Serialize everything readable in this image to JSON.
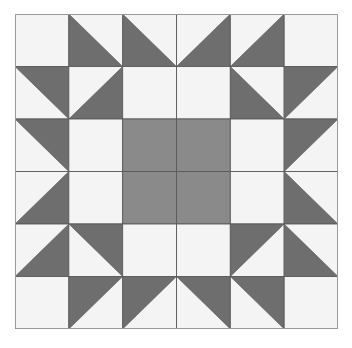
{
  "diagram": {
    "grid": {
      "rows": 6,
      "cols": 6
    },
    "colors": {
      "light": "#f4f4f4",
      "dark": "#6e6e6e",
      "center": "#8a8a8a",
      "line": "#5a5a5a",
      "border": "#9a9a9a"
    },
    "legend_codes": {
      "W": "plain light square",
      "C": "plain medium-gray center square",
      "TL": "half-square triangle, dark in top-left half",
      "TR": "half-square triangle, dark in top-right half",
      "BL": "half-square triangle, dark in bottom-left half",
      "BR": "half-square triangle, dark in bottom-right half"
    },
    "cells": [
      [
        "W",
        "BL",
        "BL",
        "BR",
        "BR",
        "W"
      ],
      [
        "TR",
        "BR",
        "W",
        "W",
        "BL",
        "TL"
      ],
      [
        "TR",
        "W",
        "C",
        "C",
        "W",
        "TL"
      ],
      [
        "BR",
        "W",
        "C",
        "C",
        "W",
        "BL"
      ],
      [
        "BR",
        "TR",
        "W",
        "W",
        "TL",
        "BL"
      ],
      [
        "W",
        "TL",
        "TL",
        "TR",
        "TR",
        "W"
      ]
    ]
  }
}
